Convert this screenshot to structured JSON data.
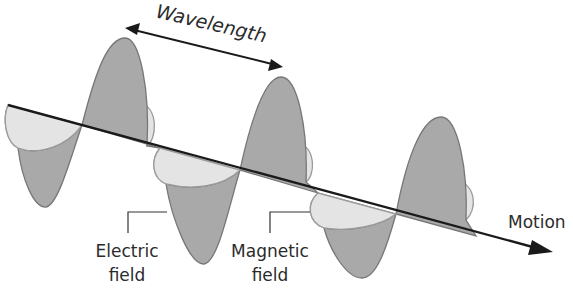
{
  "diagram": {
    "labels": {
      "wavelength": "Wavelength",
      "motion": "Motion",
      "electric_line1": "Electric",
      "electric_line2": "field",
      "magnetic_line1": "Magnetic",
      "magnetic_line2": "field"
    },
    "colors": {
      "electric_field_fill": "#a9a9a9",
      "electric_field_stroke": "#777777",
      "magnetic_field_fill": "#e4e4e4",
      "magnetic_field_stroke": "#9a9a9a",
      "axis": "#1a1a1a",
      "text": "#2b2b2b",
      "background": "#ffffff"
    },
    "components": [
      "electric field wave (vertical)",
      "magnetic field wave (horizontal)",
      "direction of motion axis",
      "wavelength indicator"
    ]
  }
}
